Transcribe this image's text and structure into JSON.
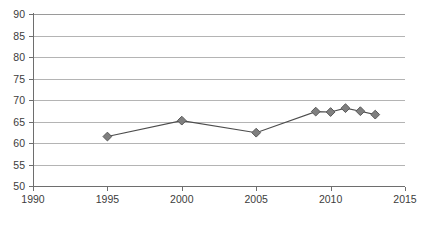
{
  "chart_data": {
    "type": "line",
    "title": "",
    "subtitle": "",
    "xlabel": "",
    "ylabel": "",
    "xlim": [
      1990,
      2015
    ],
    "ylim": [
      50,
      90
    ],
    "x_ticks": [
      1990,
      1995,
      2000,
      2005,
      2010,
      2015
    ],
    "y_ticks": [
      50,
      55,
      60,
      65,
      70,
      75,
      80,
      85,
      90
    ],
    "grid": "horizontal",
    "legend": "none",
    "marker_style": "diamond",
    "series": [
      {
        "name": "series-1",
        "x": [
          1995,
          2000,
          2005,
          2009,
          2010,
          2011,
          2012,
          2013
        ],
        "values": [
          61.5,
          65.2,
          62.4,
          67.3,
          67.2,
          68.1,
          67.4,
          66.6
        ]
      }
    ],
    "colors": {
      "marker_fill": "#7f7f7f",
      "marker_stroke": "#595959",
      "line": "#4d4d4d",
      "gridline": "#b4b4b4",
      "axis": "#6e6e6e",
      "tick_label": "#3c3c3c",
      "background": "#ffffff"
    }
  }
}
